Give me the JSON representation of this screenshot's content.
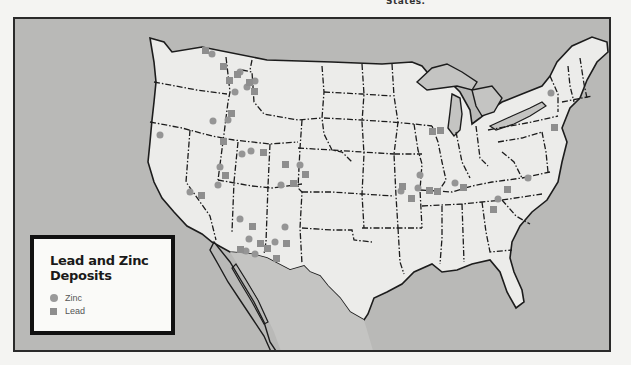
{
  "page": {
    "top_fragment": "States."
  },
  "map": {
    "colors": {
      "ocean": "#b9b9b7",
      "land": "#ececea",
      "water_lakes": "#c4c4c2",
      "border": "#1c1c1c",
      "marker": "#959595",
      "frame": "#2a2a2a"
    }
  },
  "legend": {
    "title_line1": "Lead and Zinc",
    "title_line2": "Deposits",
    "items": [
      {
        "label": "Zinc",
        "symbol": "circle-icon"
      },
      {
        "label": "Lead",
        "symbol": "square-icon"
      }
    ]
  },
  "deposits": {
    "zinc": [
      [
        210,
        52
      ],
      [
        238,
        70
      ],
      [
        232,
        76
      ],
      [
        240,
        82
      ],
      [
        233,
        91
      ],
      [
        230,
        110
      ],
      [
        226,
        118
      ],
      [
        221,
        136
      ],
      [
        158,
        133
      ],
      [
        254,
        150
      ],
      [
        246,
        152
      ],
      [
        244,
        160
      ],
      [
        248,
        157
      ],
      [
        297,
        162
      ],
      [
        215,
        163
      ],
      [
        217,
        182
      ],
      [
        280,
        182
      ],
      [
        185,
        190
      ],
      [
        239,
        221
      ],
      [
        251,
        236
      ],
      [
        245,
        248
      ],
      [
        275,
        240
      ],
      [
        258,
        250
      ],
      [
        284,
        238
      ],
      [
        416,
        172
      ],
      [
        416,
        186
      ],
      [
        396,
        185
      ],
      [
        440,
        181
      ],
      [
        452,
        180
      ],
      [
        488,
        188
      ],
      [
        497,
        197
      ],
      [
        487,
        208
      ],
      [
        433,
        130
      ],
      [
        548,
        90
      ],
      [
        520,
        176
      ],
      [
        525,
        182
      ],
      [
        298,
        185
      ],
      [
        200,
        176
      ]
    ],
    "lead": [
      [
        203,
        48
      ],
      [
        215,
        50
      ],
      [
        222,
        62
      ],
      [
        234,
        70
      ],
      [
        236,
        86
      ],
      [
        246,
        79
      ],
      [
        256,
        86
      ],
      [
        227,
        117
      ],
      [
        224,
        137
      ],
      [
        283,
        155
      ],
      [
        291,
        168
      ],
      [
        301,
        172
      ],
      [
        286,
        185
      ],
      [
        216,
        178
      ],
      [
        240,
        211
      ],
      [
        289,
        218
      ],
      [
        255,
        245
      ],
      [
        268,
        242
      ],
      [
        260,
        251
      ],
      [
        281,
        248
      ],
      [
        271,
        254
      ],
      [
        233,
        240
      ],
      [
        425,
        129
      ],
      [
        438,
        129
      ],
      [
        410,
        183
      ],
      [
        408,
        198
      ],
      [
        428,
        189
      ],
      [
        436,
        189
      ],
      [
        460,
        182
      ],
      [
        505,
        185
      ],
      [
        527,
        176
      ],
      [
        551,
        127
      ],
      [
        303,
        175
      ]
    ]
  }
}
